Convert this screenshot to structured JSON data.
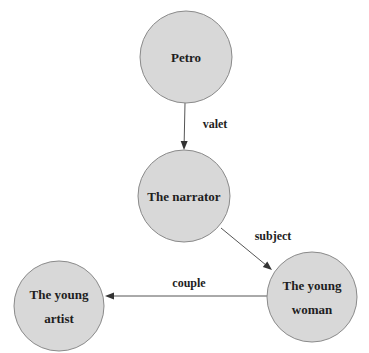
{
  "diagram": {
    "type": "relationship graph",
    "nodes": [
      {
        "id": "petro",
        "lines": [
          "Petro"
        ]
      },
      {
        "id": "narrator",
        "lines": [
          "The narrator"
        ]
      },
      {
        "id": "young_woman",
        "lines": [
          "The young",
          "woman"
        ]
      },
      {
        "id": "young_artist",
        "lines": [
          "The young",
          "artist"
        ]
      }
    ],
    "edges": [
      {
        "from": "petro",
        "to": "narrator",
        "label": "valet"
      },
      {
        "from": "narrator",
        "to": "young_woman",
        "label": "subject"
      },
      {
        "from": "young_woman",
        "to": "young_artist",
        "label": "couple"
      }
    ]
  }
}
